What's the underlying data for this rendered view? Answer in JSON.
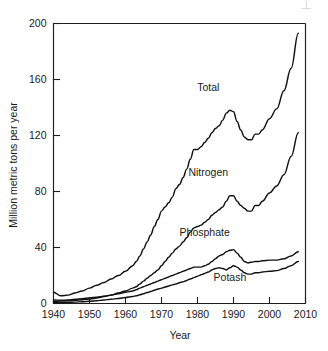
{
  "chart_data": {
    "type": "line",
    "title": "",
    "xlabel": "Year",
    "ylabel": "Million metric tons per year",
    "xlim": [
      1940,
      2010
    ],
    "ylim": [
      0,
      200
    ],
    "xticks": [
      1940,
      1950,
      1960,
      1970,
      1980,
      1990,
      2000,
      2010
    ],
    "yticks": [
      0,
      40,
      80,
      120,
      160,
      200
    ],
    "xtick_labels": [
      "1940",
      "1950",
      "1960",
      "1970",
      "1980",
      "1990",
      "2000",
      "2010"
    ],
    "ytick_labels": [
      "0",
      "40",
      "80",
      "120",
      "160",
      "200"
    ],
    "grid": false,
    "legend": "inline-labels",
    "line_color": "#111111",
    "x": [
      1940,
      1942,
      1944,
      1946,
      1948,
      1950,
      1952,
      1954,
      1956,
      1958,
      1960,
      1962,
      1963,
      1964,
      1965,
      1966,
      1967,
      1968,
      1969,
      1970,
      1971,
      1972,
      1973,
      1974,
      1975,
      1976,
      1977,
      1978,
      1979,
      1980,
      1981,
      1982,
      1983,
      1984,
      1985,
      1986,
      1987,
      1988,
      1989,
      1990,
      1991,
      1992,
      1993,
      1994,
      1995,
      1996,
      1997,
      1998,
      2000,
      2002,
      2004,
      2006,
      2008
    ],
    "series": [
      {
        "name": "Total",
        "label": "Total",
        "values": [
          8,
          5.5,
          6,
          7.5,
          9,
          11,
          13,
          15,
          17.5,
          20,
          23,
          27,
          30,
          34,
          39,
          44,
          49,
          55,
          60,
          66,
          69,
          72,
          76,
          82,
          85,
          90,
          96,
          103,
          110,
          110,
          112,
          115,
          118,
          122,
          125,
          127,
          131,
          136,
          138,
          137,
          130,
          124,
          119,
          117,
          117,
          121,
          121,
          124,
          132,
          139,
          152,
          168,
          193
        ]
      },
      {
        "name": "Nitrogen",
        "label": "Nitrogen",
        "values": [
          1.5,
          1.7,
          2,
          2.3,
          2.7,
          3.2,
          4,
          5,
          6,
          7.5,
          9,
          11,
          12,
          14,
          16,
          18,
          20,
          22,
          24,
          27,
          30,
          33,
          36,
          39,
          41,
          44,
          47,
          51,
          54,
          55,
          56,
          58,
          60,
          63,
          65,
          67,
          69,
          73,
          77,
          77,
          73,
          70,
          68,
          66,
          66,
          70,
          70,
          73,
          79,
          84,
          92,
          105,
          122
        ]
      },
      {
        "name": "Phosphate",
        "label": "Phosphate",
        "values": [
          2.5,
          2.3,
          2.5,
          3,
          3.5,
          4,
          4.5,
          5.2,
          6,
          7,
          8,
          9,
          9.8,
          11,
          12,
          13,
          14,
          15,
          16,
          17,
          18,
          19,
          20,
          21,
          22,
          23,
          24,
          25,
          26,
          26,
          26,
          27,
          28,
          30,
          32,
          34,
          35,
          37,
          38,
          38.5,
          36,
          33,
          30,
          29,
          29.5,
          30,
          30,
          30.5,
          31,
          31,
          32,
          34,
          37
        ]
      },
      {
        "name": "Potash",
        "label": "Potash",
        "values": [
          0.5,
          0.6,
          0.8,
          1,
          1.3,
          1.6,
          2,
          2.5,
          3,
          3.6,
          4.3,
          5,
          5.5,
          6.2,
          7,
          7.8,
          8.6,
          9.5,
          10.3,
          11,
          11.8,
          12.5,
          13.3,
          14,
          14.8,
          15.6,
          16.5,
          17.5,
          18.5,
          19.5,
          20.5,
          21.5,
          22.5,
          24,
          25,
          25.5,
          25,
          24,
          25.5,
          27,
          26,
          24,
          22,
          21,
          21,
          22,
          22,
          22.5,
          23,
          23.5,
          25,
          27,
          30
        ]
      }
    ],
    "annotations": [
      {
        "text": "Total",
        "x": 1983,
        "y": 152
      },
      {
        "text": "Nitrogen",
        "x": 1983,
        "y": 91
      },
      {
        "text": "Phosphate",
        "x": 1982,
        "y": 48
      },
      {
        "text": "Potash",
        "x": 1989,
        "y": 16
      }
    ]
  }
}
